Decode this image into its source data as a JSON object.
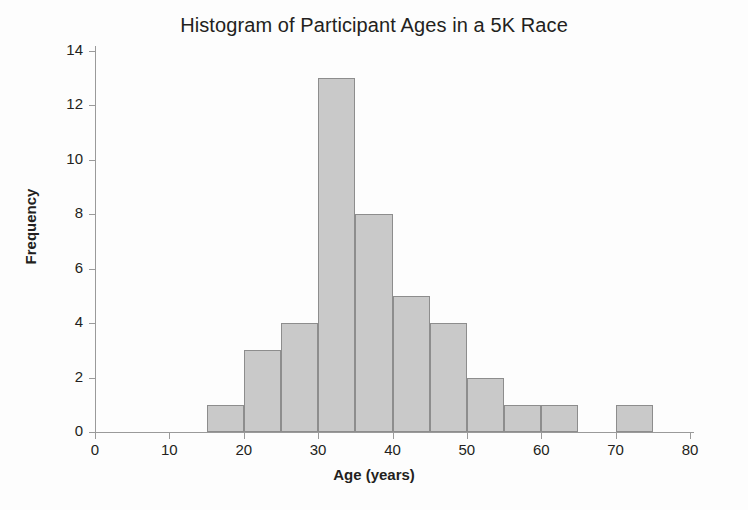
{
  "chart_data": {
    "type": "bar",
    "title": "Histogram of Participant Ages in a 5K Race",
    "xlabel": "Age (years)",
    "ylabel": "Frequency",
    "xlim": [
      0,
      80
    ],
    "ylim": [
      0,
      14
    ],
    "xticks": [
      0,
      10,
      20,
      30,
      40,
      50,
      60,
      70,
      80
    ],
    "yticks": [
      0,
      2,
      4,
      6,
      8,
      10,
      12,
      14
    ],
    "grid": false,
    "legend": null,
    "bin_width": 5,
    "bin_edges": [
      15,
      20,
      25,
      30,
      35,
      40,
      45,
      50,
      55,
      60,
      65,
      70,
      75
    ],
    "categories": [
      "15-20",
      "20-25",
      "25-30",
      "30-35",
      "35-40",
      "40-45",
      "45-50",
      "50-55",
      "55-60",
      "60-65",
      "65-70",
      "70-75"
    ],
    "values": [
      1,
      3,
      4,
      13,
      8,
      5,
      4,
      2,
      1,
      1,
      0,
      1
    ],
    "bars": [
      {
        "start": 15,
        "end": 20,
        "value": 1
      },
      {
        "start": 20,
        "end": 25,
        "value": 3
      },
      {
        "start": 25,
        "end": 30,
        "value": 4
      },
      {
        "start": 30,
        "end": 35,
        "value": 13
      },
      {
        "start": 35,
        "end": 40,
        "value": 8
      },
      {
        "start": 40,
        "end": 45,
        "value": 5
      },
      {
        "start": 45,
        "end": 50,
        "value": 4
      },
      {
        "start": 50,
        "end": 55,
        "value": 2
      },
      {
        "start": 55,
        "end": 60,
        "value": 1
      },
      {
        "start": 60,
        "end": 65,
        "value": 1
      },
      {
        "start": 65,
        "end": 70,
        "value": 0
      },
      {
        "start": 70,
        "end": 75,
        "value": 1
      }
    ],
    "bar_fill_color": "#c9c9c9",
    "bar_edge_color": "#8d8d8d",
    "axis_color": "#9a9a9a",
    "text_color": "#231f20",
    "background_color": "#ffffff"
  }
}
